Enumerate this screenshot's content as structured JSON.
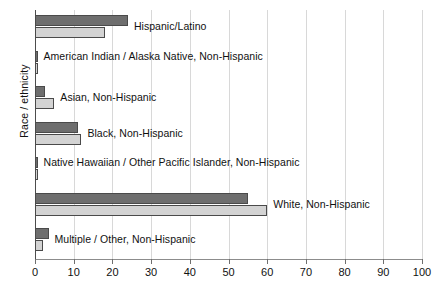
{
  "chart_data": {
    "type": "bar",
    "orientation": "horizontal",
    "title": "",
    "xlabel": "",
    "ylabel": "Race / ethnicity",
    "xlim": [
      0,
      100
    ],
    "xticks": [
      0,
      10,
      20,
      30,
      40,
      50,
      60,
      70,
      80,
      90,
      100
    ],
    "xtick_labels": [
      "0",
      "10",
      "20",
      "30",
      "40",
      "50",
      "60",
      "70",
      "80",
      "90",
      "100"
    ],
    "grid": true,
    "legend": "none",
    "categories": [
      "Hispanic/Latino",
      "American Indian / Alaska Native, Non-Hispanic",
      "Asian, Non-Hispanic",
      "Black, Non-Hispanic",
      "Native Hawaiian / Other Pacific Islander, Non-Hispanic",
      "White, Non-Hispanic",
      "Multiple / Other, Non-Hispanic"
    ],
    "series": [
      {
        "name": "series-a",
        "color": "#6e6e6e",
        "values": [
          24,
          0.5,
          2.7,
          11,
          0.4,
          55,
          3.5
        ]
      },
      {
        "name": "series-b",
        "color": "#d3d3d3",
        "values": [
          18,
          0.5,
          5,
          12,
          0.4,
          60,
          2
        ]
      }
    ]
  },
  "colors": {
    "series_a": "#6e6e6e",
    "series_b": "#d3d3d3",
    "bar_outline": "#4a4a4a",
    "gridline": "#d8d8d8",
    "axis": "#8c8c8c",
    "text": "#111111",
    "background": "#ffffff"
  }
}
